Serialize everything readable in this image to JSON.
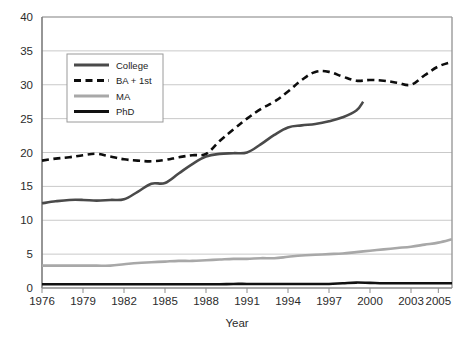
{
  "chart_data": {
    "type": "line",
    "title": "",
    "xlabel": "Year",
    "ylabel": "",
    "xlim": [
      1976,
      2006
    ],
    "ylim": [
      0,
      40
    ],
    "grid": true,
    "grid_axis": "y",
    "legend_position": "top-left-inside",
    "yticks": [
      0,
      5,
      10,
      15,
      20,
      25,
      30,
      35,
      40
    ],
    "ytick_labels": [
      "0",
      "5",
      "10",
      "15",
      "20",
      "25",
      "30",
      "35",
      "40"
    ],
    "xticks": [
      1976,
      1979,
      1982,
      1985,
      1988,
      1991,
      1994,
      1997,
      2000,
      2003,
      2005
    ],
    "xtick_labels": [
      "1976",
      "1979",
      "1982",
      "1985",
      "1988",
      "1991",
      "1994",
      "1997",
      "2000",
      "2003",
      "2005"
    ],
    "x": [
      1976,
      1977,
      1978,
      1979,
      1980,
      1981,
      1982,
      1983,
      1984,
      1985,
      1986,
      1987,
      1988,
      1989,
      1990,
      1991,
      1992,
      1993,
      1994,
      1995,
      1996,
      1997,
      1998,
      1999,
      2000,
      2001,
      2002,
      2003,
      2004,
      2005,
      2006
    ],
    "series": [
      {
        "name": "College",
        "color": "#4a4a4a",
        "style": "solid",
        "width": 2.6,
        "x_end": 1999.5,
        "values": [
          12.5,
          12.8,
          13.0,
          13.0,
          12.9,
          13.0,
          13.1,
          14.2,
          15.4,
          15.5,
          16.9,
          18.3,
          19.4,
          19.8,
          19.9,
          20.0,
          21.2,
          22.6,
          23.7,
          24.0,
          24.2,
          24.6,
          25.2,
          26.2,
          27.5,
          null,
          null,
          null,
          null,
          null,
          null
        ]
      },
      {
        "name": "BA + 1st",
        "color": "#0d0d0d",
        "style": "dashed",
        "width": 2.6,
        "values": [
          18.8,
          19.1,
          19.3,
          19.6,
          19.8,
          19.4,
          19.0,
          18.8,
          18.7,
          18.9,
          19.3,
          19.6,
          19.8,
          21.7,
          23.4,
          25.0,
          26.4,
          27.5,
          29.0,
          30.7,
          31.9,
          31.9,
          31.2,
          30.6,
          30.7,
          30.6,
          30.3,
          30.0,
          31.4,
          32.7,
          33.4
        ]
      },
      {
        "name": "MA",
        "color": "#a8a8a8",
        "style": "solid",
        "width": 2.6,
        "values": [
          3.3,
          3.3,
          3.3,
          3.3,
          3.3,
          3.3,
          3.5,
          3.7,
          3.8,
          3.9,
          4.0,
          4.0,
          4.1,
          4.2,
          4.3,
          4.3,
          4.4,
          4.4,
          4.6,
          4.8,
          4.9,
          5.0,
          5.1,
          5.3,
          5.5,
          5.7,
          5.9,
          6.1,
          6.4,
          6.7,
          7.2
        ]
      },
      {
        "name": "PhD",
        "color": "#111111",
        "style": "solid",
        "width": 2.6,
        "values": [
          0.55,
          0.55,
          0.55,
          0.55,
          0.55,
          0.55,
          0.55,
          0.55,
          0.55,
          0.55,
          0.55,
          0.55,
          0.55,
          0.55,
          0.6,
          0.6,
          0.6,
          0.6,
          0.6,
          0.6,
          0.6,
          0.6,
          0.7,
          0.8,
          0.75,
          0.7,
          0.7,
          0.7,
          0.7,
          0.7,
          0.7
        ]
      }
    ]
  },
  "legend": {
    "entries": [
      {
        "label": "College"
      },
      {
        "label": "BA + 1st"
      },
      {
        "label": "MA"
      },
      {
        "label": "PhD"
      }
    ]
  },
  "colors": {
    "background": "#ffffff",
    "gridline": "#c9c9c9",
    "frame": "#9a9a9a",
    "axis_text": "#2b2b2b"
  }
}
